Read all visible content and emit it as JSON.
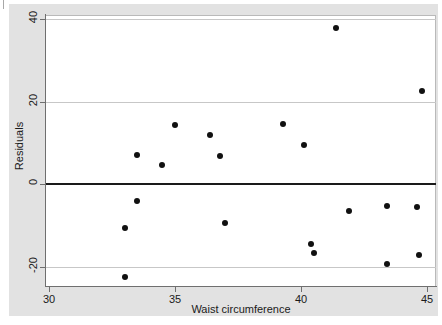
{
  "chart_data": {
    "type": "scatter",
    "title": "",
    "xlabel": "Waist circumference",
    "ylabel": "Residuals",
    "xlim": [
      30,
      45
    ],
    "ylim": [
      -23.5,
      42
    ],
    "xticks": [
      30,
      35,
      40,
      45
    ],
    "xtick_labels": [
      "30",
      "35",
      "40",
      "45"
    ],
    "yticks": [
      -20,
      0,
      20,
      40
    ],
    "ytick_labels": [
      "-20",
      "0",
      "20",
      "40"
    ],
    "grid": "horizontal",
    "gridlines": [
      40,
      20,
      -20
    ],
    "reference_line": {
      "y": 0,
      "style": "solid",
      "color": "#1a1a1a"
    },
    "legend": null,
    "marker": {
      "shape": "circle",
      "color": "#111111",
      "size": 6
    },
    "points": [
      {
        "x": 33.0,
        "y": -22.5
      },
      {
        "x": 33.0,
        "y": -10.7
      },
      {
        "x": 33.5,
        "y": 7.0
      },
      {
        "x": 33.5,
        "y": -4.1
      },
      {
        "x": 34.5,
        "y": 4.6
      },
      {
        "x": 35.0,
        "y": 14.3
      },
      {
        "x": 36.4,
        "y": 11.9
      },
      {
        "x": 36.8,
        "y": 6.8
      },
      {
        "x": 37.0,
        "y": -9.5
      },
      {
        "x": 39.3,
        "y": 14.5
      },
      {
        "x": 40.1,
        "y": 9.5
      },
      {
        "x": 40.4,
        "y": -14.5
      },
      {
        "x": 40.5,
        "y": -16.7
      },
      {
        "x": 41.4,
        "y": 37.8
      },
      {
        "x": 41.9,
        "y": -6.5
      },
      {
        "x": 43.4,
        "y": -5.3
      },
      {
        "x": 43.4,
        "y": -19.4
      },
      {
        "x": 44.6,
        "y": -5.6
      },
      {
        "x": 44.7,
        "y": -17.2
      },
      {
        "x": 44.8,
        "y": 22.5
      }
    ]
  },
  "colors": {
    "figure_background": "#e2e2e2",
    "plot_background": "#ffffff",
    "marker": "#111111",
    "gridline": "#c7c7c7",
    "axis": "#6f6f6f",
    "zero_line": "#1a1a1a"
  }
}
